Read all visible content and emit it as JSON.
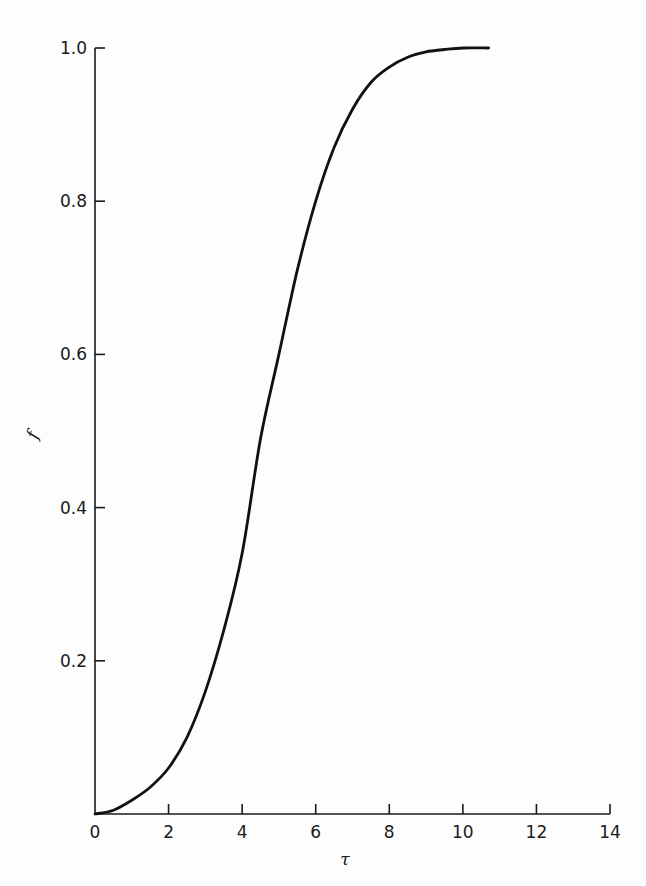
{
  "chart_data": {
    "type": "line",
    "title": "",
    "xlabel": "τ",
    "ylabel": "f",
    "xlim": [
      0,
      14
    ],
    "ylim": [
      0,
      1.0
    ],
    "xticks": [
      0,
      2,
      4,
      6,
      8,
      10,
      12,
      14
    ],
    "xtick_labels": [
      "0",
      "2",
      "4",
      "6",
      "8",
      "10",
      "12",
      "14"
    ],
    "yticks": [
      0.2,
      0.4,
      0.6,
      0.8,
      1.0
    ],
    "ytick_labels": [
      "0.2",
      "0.4",
      "0.6",
      "0.8",
      "1.0"
    ],
    "grid": false,
    "legend": null,
    "series": [
      {
        "name": "f(τ)",
        "color": "#111111",
        "x": [
          0,
          0.5,
          1.0,
          1.5,
          2.0,
          2.5,
          3.0,
          3.5,
          4.0,
          4.5,
          5.0,
          5.5,
          6.0,
          6.5,
          7.0,
          7.5,
          8.0,
          8.5,
          9.0,
          9.5,
          10.0,
          10.7
        ],
        "y": [
          0.0,
          0.005,
          0.018,
          0.035,
          0.06,
          0.1,
          0.16,
          0.24,
          0.34,
          0.49,
          0.6,
          0.71,
          0.8,
          0.87,
          0.92,
          0.955,
          0.975,
          0.988,
          0.995,
          0.998,
          1.0,
          1.0
        ]
      }
    ]
  }
}
